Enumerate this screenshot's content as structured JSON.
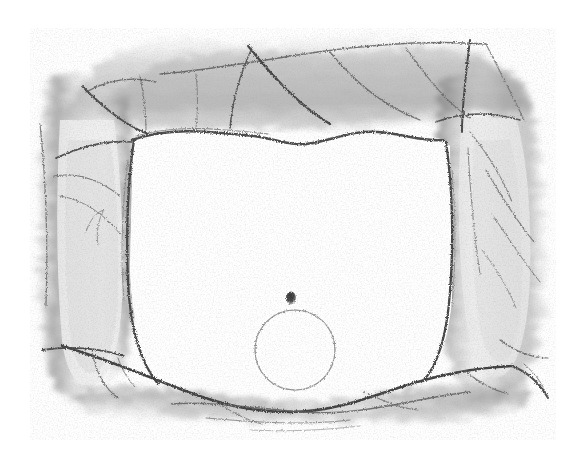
{
  "artwork": {
    "title": "Graphite sketch of a tree-trunk archway framing a blank opening",
    "medium": "pencil / charcoal on white paper",
    "canvas": {
      "width": 579,
      "height": 466,
      "background": "#ffffff"
    },
    "palette": {
      "paper": "#ffffff",
      "graphite_darkest": "#3a3a3a",
      "graphite_dark": "#5a5a5a",
      "graphite_mid": "#888888",
      "graphite_light": "#b4b4b4",
      "graphite_faint": "#d8d8d8"
    },
    "composition": {
      "drawn_bounds": {
        "left": 30,
        "top": 28,
        "right": 556,
        "bottom": 440
      },
      "opening": {
        "name": "central blank opening",
        "left": 128,
        "top": 124,
        "right": 452,
        "bottom": 392,
        "fill": "#ffffff"
      }
    },
    "elements": [
      {
        "id": "left-trunk",
        "label": "Left vertical tree trunk",
        "x": 40,
        "y": 60,
        "width": 110,
        "height": 330,
        "tone": "#8e8e8e"
      },
      {
        "id": "right-trunk",
        "label": "Right vertical tree trunk",
        "x": 432,
        "y": 58,
        "width": 118,
        "height": 330,
        "tone": "#8e8e8e"
      },
      {
        "id": "top-canopy",
        "label": "Upper branch canopy band",
        "x": 60,
        "y": 30,
        "width": 470,
        "height": 110,
        "tone": "#a0a0a0"
      },
      {
        "id": "ground-line",
        "label": "Lower ground / horizon strokes",
        "x": 70,
        "y": 360,
        "width": 470,
        "height": 80,
        "tone": "#6e6e6e"
      },
      {
        "id": "circle",
        "label": "Thin outlined circle in lower centre",
        "cx": 295,
        "cy": 350,
        "r": 40,
        "stroke": "#8a8a8a",
        "stroke_width": 1.1,
        "fill": "none"
      },
      {
        "id": "dot",
        "label": "Small dark dot above the circle",
        "cx": 291,
        "cy": 298,
        "rx": 5,
        "ry": 6.5,
        "fill": "#4a4a4a"
      }
    ]
  },
  "chart_data": {
    "type": "scatter",
    "xlabel": "x (px)",
    "ylabel": "y (px)",
    "xlim": [
      0,
      579
    ],
    "ylim": [
      466,
      0
    ],
    "grid": false,
    "legend": "none",
    "annotations": [
      "left trunk",
      "right trunk",
      "top canopy branches",
      "ground horizon",
      "circle",
      "dot"
    ],
    "series": [
      {
        "name": "circle-center",
        "x": [
          295
        ],
        "y": [
          350
        ],
        "r": [
          40
        ]
      },
      {
        "name": "dot-center",
        "x": [
          291
        ],
        "y": [
          298
        ],
        "r": [
          6
        ]
      }
    ]
  }
}
